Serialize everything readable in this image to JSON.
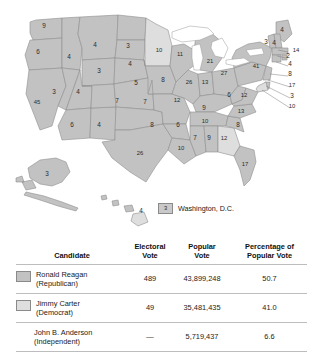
{
  "figure": {
    "colors": {
      "reagan_fill": "#c2c2c2",
      "carter_fill": "#dedede",
      "state_border": "#8e8e8e",
      "water": "#ffffff",
      "number_text": "#2b2b2b"
    }
  },
  "map": {
    "legend": {
      "dc_box_value": "3",
      "dc_label": "Washington, D.C."
    },
    "states": [
      {
        "code": "WA",
        "ev": "9",
        "winner": "reagan",
        "x": 44,
        "y": 28
      },
      {
        "code": "OR",
        "ev": "6",
        "winner": "reagan",
        "x": 38,
        "y": 54
      },
      {
        "code": "CA",
        "ev": "45",
        "winner": "reagan",
        "x": 37,
        "y": 104
      },
      {
        "code": "ID",
        "ev": "4",
        "winner": "reagan",
        "x": 69,
        "y": 59
      },
      {
        "code": "NV",
        "ev": "3",
        "winner": "reagan",
        "x": 54,
        "y": 94
      },
      {
        "code": "MT",
        "ev": "4",
        "winner": "reagan",
        "x": 95,
        "y": 47
      },
      {
        "code": "WY",
        "ev": "3",
        "winner": "reagan",
        "x": 99,
        "y": 73
      },
      {
        "code": "UT",
        "ev": "4",
        "winner": "reagan",
        "x": 78,
        "y": 94
      },
      {
        "code": "AZ",
        "ev": "6",
        "winner": "reagan",
        "x": 72,
        "y": 127
      },
      {
        "code": "NM",
        "ev": "4",
        "winner": "reagan",
        "x": 99,
        "y": 127
      },
      {
        "code": "CO",
        "ev": "7",
        "winner": "reagan",
        "x": 117,
        "y": 103
      },
      {
        "code": "ND",
        "ev": "3",
        "winner": "reagan",
        "x": 128,
        "y": 48
      },
      {
        "code": "SD",
        "ev": "4",
        "winner": "reagan",
        "x": 130,
        "y": 66
      },
      {
        "code": "NE",
        "ev": "5",
        "winner": "reagan",
        "x": 136,
        "y": 85
      },
      {
        "code": "KS",
        "ev": "7",
        "winner": "reagan",
        "x": 145,
        "y": 104
      },
      {
        "code": "OK",
        "ev": "8",
        "winner": "reagan",
        "x": 152,
        "y": 127
      },
      {
        "code": "TX",
        "ev": "26",
        "winner": "reagan",
        "x": 140,
        "y": 155
      },
      {
        "code": "MN",
        "ev": "10",
        "winner": "carter",
        "x": 159,
        "y": 52
      },
      {
        "code": "IA",
        "ev": "8",
        "winner": "reagan",
        "x": 163,
        "y": 82
      },
      {
        "code": "MO",
        "ev": "12",
        "winner": "reagan",
        "x": 177,
        "y": 102
      },
      {
        "code": "AR",
        "ev": "6",
        "winner": "reagan",
        "x": 178,
        "y": 127
      },
      {
        "code": "LA",
        "ev": "10",
        "winner": "reagan",
        "x": 181,
        "y": 150
      },
      {
        "code": "WI",
        "ev": "11",
        "winner": "reagan",
        "x": 180,
        "y": 56
      },
      {
        "code": "IL",
        "ev": "26",
        "winner": "reagan",
        "x": 189,
        "y": 84
      },
      {
        "code": "MI",
        "ev": "21",
        "winner": "reagan",
        "x": 210,
        "y": 63
      },
      {
        "code": "IN",
        "ev": "13",
        "winner": "reagan",
        "x": 205,
        "y": 84
      },
      {
        "code": "KY",
        "ev": "9",
        "winner": "reagan",
        "x": 204,
        "y": 110
      },
      {
        "code": "TN",
        "ev": "10",
        "winner": "reagan",
        "x": 205,
        "y": 123
      },
      {
        "code": "MS",
        "ev": "7",
        "winner": "reagan",
        "x": 195,
        "y": 140
      },
      {
        "code": "AL",
        "ev": "9",
        "winner": "reagan",
        "x": 209,
        "y": 140
      },
      {
        "code": "OH",
        "ev": "27",
        "winner": "reagan",
        "x": 224,
        "y": 75
      },
      {
        "code": "WV",
        "ev": "6",
        "winner": "reagan",
        "x": 229,
        "y": 97
      },
      {
        "code": "GA",
        "ev": "12",
        "winner": "carter",
        "x": 224,
        "y": 140
      },
      {
        "code": "FL",
        "ev": "17",
        "winner": "reagan",
        "x": 245,
        "y": 166
      },
      {
        "code": "VA",
        "ev": "12",
        "winner": "reagan",
        "x": 244,
        "y": 97
      },
      {
        "code": "NC",
        "ev": "13",
        "winner": "reagan",
        "x": 241,
        "y": 113
      },
      {
        "code": "SC",
        "ev": "8",
        "winner": "reagan",
        "x": 238,
        "y": 127
      },
      {
        "code": "NY",
        "ev": "41",
        "winner": "reagan",
        "x": 256,
        "y": 68
      },
      {
        "code": "ME",
        "ev": "4",
        "winner": "reagan",
        "x": 282,
        "y": 32
      },
      {
        "code": "VT",
        "ev": "3",
        "winner": "reagan",
        "x": 266,
        "y": 44
      },
      {
        "code": "NH",
        "ev": "4",
        "winner": "reagan",
        "x": 274,
        "y": 45
      },
      {
        "code": "MA",
        "ev": "14",
        "winner": "reagan",
        "x": 296,
        "y": 52
      },
      {
        "code": "RI",
        "ev": "2",
        "winner": "reagan",
        "x": 288,
        "y": 58
      },
      {
        "code": "CT",
        "ev": "4",
        "winner": "reagan",
        "x": 290,
        "y": 66
      },
      {
        "code": "NJ",
        "ev": "8",
        "winner": "reagan",
        "x": 290,
        "y": 76
      },
      {
        "code": "PA",
        "ev": "17",
        "winner": "reagan",
        "x": 292,
        "y": 87
      },
      {
        "code": "DE",
        "ev": "3",
        "winner": "reagan",
        "x": 292,
        "y": 98
      },
      {
        "code": "MD",
        "ev": "10",
        "winner": "carter",
        "x": 292,
        "y": 108
      },
      {
        "code": "AK",
        "ev": "3",
        "winner": "reagan",
        "x": 47,
        "y": 176
      },
      {
        "code": "HI",
        "ev": "4",
        "winner": "carter",
        "x": 141,
        "y": 213
      }
    ]
  },
  "table": {
    "headers": {
      "candidate": "Candidate",
      "electoral_vote": "Electoral\nVote",
      "electoral_vote_l1": "Electoral",
      "electoral_vote_l2": "Vote",
      "popular_vote_l1": "Popular",
      "popular_vote_l2": "Vote",
      "percentage_l1": "Percentage of",
      "percentage_l2": "Popular Vote"
    },
    "rows": [
      {
        "name": "Ronald Reagan",
        "party": "(Republican)",
        "electoral_vote": "489",
        "popular_vote": "43,899,248",
        "percentage": "50.7",
        "swatch": "#c2c2c2",
        "has_swatch": true
      },
      {
        "name": "Jimmy Carter",
        "party": "(Democrat)",
        "electoral_vote": "49",
        "popular_vote": "35,481,435",
        "percentage": "41.0",
        "swatch": "#dedede",
        "has_swatch": true
      },
      {
        "name": "John B. Anderson",
        "party": "(Independent)",
        "electoral_vote": "—",
        "popular_vote": "5,719,437",
        "percentage": "6.6",
        "swatch": "",
        "has_swatch": false
      }
    ]
  }
}
